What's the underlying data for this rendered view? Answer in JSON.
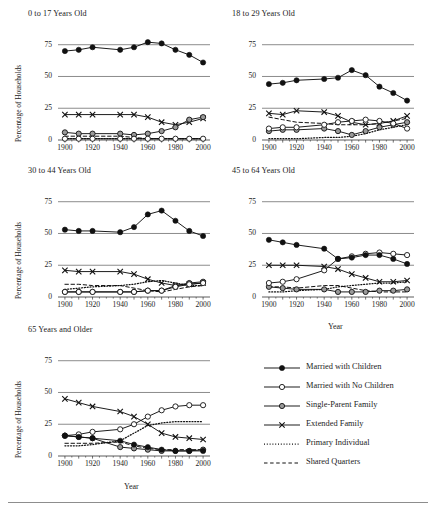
{
  "figure": {
    "axis_label_y": "Percentage of Households",
    "axis_label_x": "Year",
    "y_ticks": [
      "75",
      "50",
      "25",
      "0"
    ],
    "y_tick_values": [
      75,
      50,
      25,
      0
    ],
    "x_ticks": [
      "1900",
      "1920",
      "1940",
      "1960",
      "1980",
      "2000"
    ],
    "x_tick_values": [
      1900,
      1920,
      1940,
      1960,
      1980,
      2000
    ],
    "line_color": "#1a1a1a",
    "gridline_color": "#6e6e6e",
    "marker_fill_single_parent": "#9a9a9a",
    "background": "#ffffff"
  },
  "legend": {
    "position": "bottom-right",
    "entries": [
      {
        "label": "Married with Children",
        "marker": "filled-circle",
        "line": "solid"
      },
      {
        "label": "Married with No Children",
        "marker": "open-circle",
        "line": "solid"
      },
      {
        "label": "Single-Parent Family",
        "marker": "grey-circle",
        "line": "solid"
      },
      {
        "label": "Extended Family",
        "marker": "cross",
        "line": "solid"
      },
      {
        "label": "Primary Individual",
        "marker": "none",
        "line": "dotted"
      },
      {
        "label": "Shared Quarters",
        "marker": "none",
        "line": "dashed"
      }
    ]
  },
  "chart_data": [
    {
      "type": "line",
      "title": "0 to 17 Years Old",
      "xlabel": "",
      "ylabel": "Percentage of Households",
      "xlim": [
        1895,
        2005
      ],
      "ylim": [
        0,
        85
      ],
      "x": [
        1900,
        1910,
        1920,
        1940,
        1950,
        1960,
        1970,
        1980,
        1990,
        2000
      ],
      "grid": true,
      "series": [
        {
          "name": "Married with Children",
          "values": [
            70,
            71,
            73,
            71,
            73,
            77,
            76,
            71,
            67,
            61
          ]
        },
        {
          "name": "Married with No Children",
          "values": [
            1,
            1,
            1,
            1,
            1,
            1,
            1,
            1,
            1,
            1
          ]
        },
        {
          "name": "Single-Parent Family",
          "values": [
            6,
            5,
            5,
            5,
            4,
            5,
            7,
            10,
            16,
            18
          ]
        },
        {
          "name": "Extended Family",
          "values": [
            20,
            20,
            20,
            20,
            20,
            18,
            14,
            12,
            14,
            17
          ]
        },
        {
          "name": "Primary Individual",
          "values": [
            1,
            1,
            1,
            1,
            1,
            1,
            1,
            1,
            1,
            1
          ]
        },
        {
          "name": "Shared Quarters",
          "values": [
            3,
            3,
            3,
            3,
            2,
            1,
            1,
            1,
            1,
            1
          ]
        }
      ]
    },
    {
      "type": "line",
      "title": "18 to 29 Years Old",
      "xlabel": "",
      "ylabel": "",
      "xlim": [
        1895,
        2005
      ],
      "ylim": [
        0,
        85
      ],
      "x": [
        1900,
        1910,
        1920,
        1940,
        1950,
        1960,
        1970,
        1980,
        1990,
        2000
      ],
      "grid": true,
      "series": [
        {
          "name": "Married with Children",
          "values": [
            44,
            45,
            47,
            48,
            49,
            55,
            51,
            42,
            37,
            31
          ]
        },
        {
          "name": "Married with No Children",
          "values": [
            9,
            10,
            10,
            12,
            14,
            15,
            16,
            15,
            13,
            9
          ]
        },
        {
          "name": "Single-Parent Family",
          "values": [
            7,
            8,
            8,
            9,
            7,
            4,
            7,
            10,
            12,
            14
          ]
        },
        {
          "name": "Extended Family",
          "values": [
            21,
            20,
            23,
            22,
            19,
            14,
            12,
            13,
            15,
            19
          ]
        },
        {
          "name": "Primary Individual",
          "values": [
            1,
            1,
            1,
            2,
            2,
            3,
            5,
            8,
            10,
            12
          ]
        },
        {
          "name": "Shared Quarters",
          "values": [
            18,
            16,
            14,
            13,
            12,
            12,
            12,
            13,
            15,
            17
          ]
        }
      ]
    },
    {
      "type": "line",
      "title": "30 to 44 Years Old",
      "xlabel": "",
      "ylabel": "Percentage of Households",
      "xlim": [
        1895,
        2005
      ],
      "ylim": [
        0,
        85
      ],
      "x": [
        1900,
        1910,
        1920,
        1940,
        1950,
        1960,
        1970,
        1980,
        1990,
        2000
      ],
      "grid": true,
      "series": [
        {
          "name": "Married with Children",
          "values": [
            53,
            52,
            52,
            51,
            55,
            65,
            68,
            60,
            52,
            48
          ]
        },
        {
          "name": "Married with No Children",
          "values": [
            4,
            4,
            4,
            4,
            4,
            5,
            5,
            8,
            10,
            11
          ]
        },
        {
          "name": "Single-Parent Family",
          "values": [
            4,
            4,
            4,
            4,
            4,
            5,
            5,
            9,
            11,
            12
          ]
        },
        {
          "name": "Extended Family",
          "values": [
            21,
            20,
            20,
            20,
            18,
            14,
            11,
            9,
            10,
            11
          ]
        },
        {
          "name": "Primary Individual",
          "values": [
            6,
            7,
            8,
            9,
            10,
            12,
            13,
            11,
            9,
            9
          ]
        },
        {
          "name": "Shared Quarters",
          "values": [
            10,
            10,
            9,
            9,
            7,
            5,
            4,
            6,
            8,
            9
          ]
        }
      ]
    },
    {
      "type": "line",
      "title": "45 to 64 Years Old",
      "xlabel": "Year",
      "ylabel": "",
      "xlim": [
        1895,
        2005
      ],
      "ylim": [
        0,
        85
      ],
      "x": [
        1900,
        1910,
        1920,
        1940,
        1950,
        1960,
        1970,
        1980,
        1990,
        2000
      ],
      "grid": true,
      "series": [
        {
          "name": "Married with Children",
          "values": [
            45,
            43,
            41,
            38,
            30,
            31,
            33,
            33,
            30,
            26
          ]
        },
        {
          "name": "Married with No Children",
          "values": [
            11,
            12,
            14,
            21,
            30,
            32,
            34,
            35,
            34,
            33
          ]
        },
        {
          "name": "Single-Parent Family",
          "values": [
            8,
            7,
            6,
            6,
            4,
            4,
            4,
            5,
            5,
            6
          ]
        },
        {
          "name": "Extended Family",
          "values": [
            25,
            25,
            25,
            24,
            22,
            18,
            15,
            12,
            12,
            13
          ]
        },
        {
          "name": "Primary Individual",
          "values": [
            4,
            4,
            5,
            6,
            8,
            9,
            10,
            11,
            11,
            12
          ]
        },
        {
          "name": "Shared Quarters",
          "values": [
            8,
            8,
            7,
            9,
            9,
            7,
            5,
            4,
            4,
            4
          ]
        }
      ]
    },
    {
      "type": "line",
      "title": "65 Years and Older",
      "xlabel": "Year",
      "ylabel": "Percentage of Households",
      "xlim": [
        1895,
        2005
      ],
      "ylim": [
        0,
        85
      ],
      "x": [
        1900,
        1910,
        1920,
        1940,
        1950,
        1960,
        1970,
        1980,
        1990,
        2000
      ],
      "grid": true,
      "series": [
        {
          "name": "Married with Children",
          "values": [
            16,
            15,
            14,
            12,
            9,
            7,
            5,
            4,
            4,
            4
          ]
        },
        {
          "name": "Married with No Children",
          "values": [
            16,
            17,
            19,
            21,
            25,
            31,
            36,
            39,
            40,
            40
          ]
        },
        {
          "name": "Single-Parent Family",
          "values": [
            16,
            15,
            14,
            7,
            6,
            5,
            4,
            4,
            4,
            5
          ]
        },
        {
          "name": "Extended Family",
          "values": [
            45,
            42,
            39,
            35,
            31,
            25,
            18,
            15,
            14,
            13
          ]
        },
        {
          "name": "Primary Individual",
          "values": [
            8,
            8,
            9,
            12,
            18,
            24,
            26,
            27,
            27,
            27
          ]
        },
        {
          "name": "Shared Quarters",
          "values": [
            10,
            10,
            10,
            11,
            8,
            6,
            5,
            5,
            5,
            5
          ]
        }
      ]
    }
  ]
}
